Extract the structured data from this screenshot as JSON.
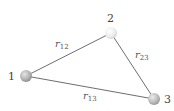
{
  "diagram": {
    "particles": [
      {
        "id": "1",
        "label": "1",
        "cx": 26,
        "cy": 76,
        "r": 6,
        "color_light": "#d8d8d8",
        "color_dark": "#8a8a8a"
      },
      {
        "id": "2",
        "label": "2",
        "cx": 111,
        "cy": 33,
        "r": 6,
        "color_light": "#ffffff",
        "color_dark": "#d6d6d6"
      },
      {
        "id": "3",
        "label": "3",
        "cx": 154,
        "cy": 99,
        "r": 6,
        "color_light": "#e0e0e0",
        "color_dark": "#9a9a9a"
      }
    ],
    "edges": [
      {
        "from": "1",
        "to": "2",
        "label_main": "r",
        "label_sub": "12"
      },
      {
        "from": "2",
        "to": "3",
        "label_main": "r",
        "label_sub": "23"
      },
      {
        "from": "1",
        "to": "3",
        "label_main": "r",
        "label_sub": "13"
      }
    ],
    "labels": {
      "p1": "1",
      "p2": "2",
      "p3": "3",
      "r12_main": "r",
      "r12_sub": "12",
      "r23_main": "r",
      "r23_sub": "23",
      "r13_main": "r",
      "r13_sub": "13"
    },
    "colors": {
      "edge": "#6e6e6e",
      "text": "#444444"
    }
  }
}
